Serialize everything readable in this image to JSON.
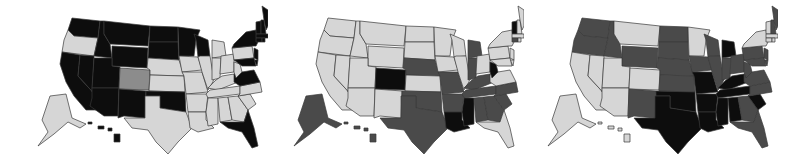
{
  "palette": {
    "light": "#d6d6d6",
    "medium": "#8c8c8c",
    "dark": "#4a4a4a",
    "black": "#0d0d0d",
    "border": "#3a3a3a",
    "background": "#ffffff"
  },
  "maps": [
    {
      "id": "map-1",
      "states": {
        "WA": "black",
        "OR": "light",
        "CA": "black",
        "NV": "black",
        "ID": "black",
        "MT": "black",
        "WY": "black",
        "UT": "black",
        "AZ": "black",
        "CO": "medium",
        "NM": "black",
        "ND": "black",
        "SD": "black",
        "NE": "light",
        "KS": "light",
        "OK": "black",
        "TX": "light",
        "MN": "black",
        "IA": "light",
        "MO": "light",
        "AR": "light",
        "LA": "light",
        "WI": "black",
        "IL": "light",
        "MI": "light",
        "IN": "light",
        "OH": "light",
        "KY": "light",
        "TN": "light",
        "MS": "light",
        "AL": "light",
        "GA": "light",
        "FL": "black",
        "SC": "light",
        "NC": "light",
        "VA": "black",
        "WV": "light",
        "PA": "light",
        "NY": "black",
        "NJ": "black",
        "DE": "black",
        "MD": "black",
        "VT": "black",
        "NH": "black",
        "ME": "black",
        "MA": "black",
        "CT": "black",
        "RI": "black",
        "AK": "light",
        "HI": "black"
      }
    },
    {
      "id": "map-2",
      "states": {
        "WA": "light",
        "OR": "light",
        "CA": "light",
        "NV": "light",
        "ID": "light",
        "MT": "light",
        "WY": "light",
        "UT": "light",
        "AZ": "light",
        "CO": "black",
        "NM": "light",
        "ND": "light",
        "SD": "light",
        "NE": "dark",
        "KS": "light",
        "OK": "dark",
        "TX": "dark",
        "MN": "light",
        "IA": "light",
        "MO": "dark",
        "AR": "dark",
        "LA": "black",
        "WI": "light",
        "IL": "light",
        "MI": "dark",
        "IN": "dark",
        "OH": "light",
        "KY": "dark",
        "TN": "dark",
        "MS": "black",
        "AL": "dark",
        "GA": "dark",
        "FL": "light",
        "SC": "dark",
        "NC": "dark",
        "VA": "light",
        "WV": "black",
        "PA": "light",
        "NY": "light",
        "NJ": "light",
        "DE": "light",
        "MD": "light",
        "VT": "black",
        "NH": "light",
        "ME": "light",
        "MA": "light",
        "CT": "dark",
        "RI": "light",
        "AK": "dark",
        "HI": "dark"
      }
    },
    {
      "id": "map-3",
      "states": {
        "WA": "dark",
        "OR": "dark",
        "CA": "light",
        "NV": "light",
        "ID": "dark",
        "MT": "light",
        "WY": "dark",
        "UT": "light",
        "AZ": "light",
        "CO": "light",
        "NM": "dark",
        "ND": "dark",
        "SD": "dark",
        "NE": "dark",
        "KS": "dark",
        "OK": "black",
        "TX": "black",
        "MN": "light",
        "IA": "dark",
        "MO": "black",
        "AR": "black",
        "LA": "black",
        "WI": "dark",
        "IL": "dark",
        "MI": "black",
        "IN": "dark",
        "OH": "dark",
        "KY": "black",
        "TN": "black",
        "MS": "black",
        "AL": "black",
        "GA": "dark",
        "FL": "dark",
        "SC": "black",
        "NC": "dark",
        "VA": "dark",
        "WV": "dark",
        "PA": "dark",
        "NY": "light",
        "NJ": "dark",
        "DE": "dark",
        "MD": "dark",
        "VT": "light",
        "NH": "dark",
        "ME": "dark",
        "MA": "light",
        "CT": "light",
        "RI": "light",
        "AK": "light",
        "HI": "light"
      }
    }
  ]
}
